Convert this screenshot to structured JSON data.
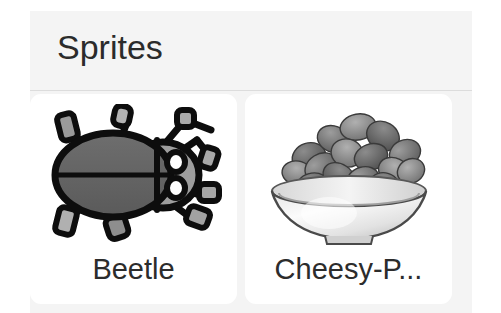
{
  "panel": {
    "title": "Sprites",
    "background_color": "#f4f4f4",
    "divider_color": "#dcdcdc"
  },
  "cards": [
    {
      "label": "Beetle",
      "icon": "beetle-sprite",
      "card_color": "#ffffff"
    },
    {
      "label": "Cheesy-P...",
      "icon": "cheesy-puffs-bowl-sprite",
      "card_color": "#ffffff"
    }
  ]
}
